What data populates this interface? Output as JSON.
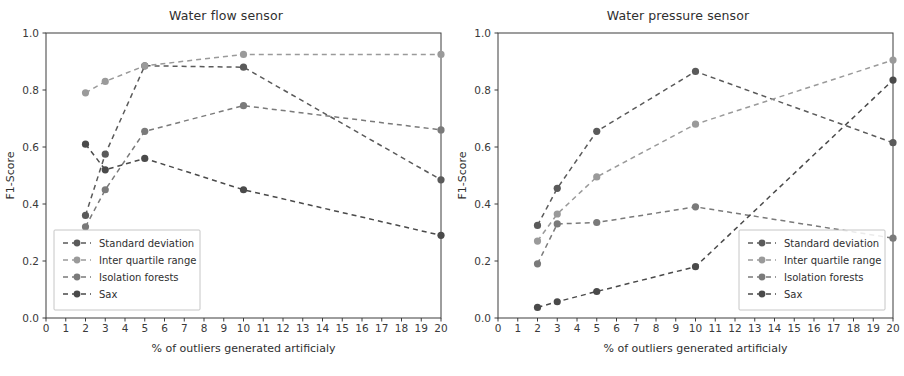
{
  "figure": {
    "width": 904,
    "height": 376,
    "background": "#ffffff"
  },
  "axis": {
    "xlabel": "% of outliers generated artificialy",
    "ylabel": "F1-Score",
    "yticks": [
      "0.0",
      "0.2",
      "0.4",
      "0.6",
      "0.8",
      "1.0"
    ],
    "xticks": [
      "0",
      "1",
      "2",
      "3",
      "4",
      "5",
      "6",
      "7",
      "8",
      "9",
      "10",
      "11",
      "12",
      "13",
      "14",
      "15",
      "16",
      "17",
      "18",
      "19",
      "20"
    ]
  },
  "legend": {
    "labels": [
      "Standard deviation",
      "Inter quartile range",
      "Isolation forests",
      "Sax"
    ]
  },
  "colors": {
    "standard_deviation": "#5a5a5a",
    "inter_quartile_range": "#9a9a9a",
    "isolation_forests": "#7a7a7a",
    "sax": "#4a4a4a",
    "axis": "#3c3c3c",
    "text": "#2f2f2f"
  },
  "chart_data": [
    {
      "type": "line",
      "title": "Water flow sensor",
      "xlabel": "% of outliers generated artificialy",
      "ylabel": "F1-Score",
      "xlim": [
        0,
        20
      ],
      "ylim": [
        0.0,
        1.0
      ],
      "grid": false,
      "legend_position": "lower left",
      "x": [
        2,
        3,
        5,
        10,
        20
      ],
      "series": [
        {
          "name": "Standard deviation",
          "values": [
            0.36,
            0.575,
            0.885,
            0.88,
            0.485
          ]
        },
        {
          "name": "Inter quartile range",
          "values": [
            0.79,
            0.83,
            0.885,
            0.925,
            0.925
          ]
        },
        {
          "name": "Isolation forests",
          "values": [
            0.32,
            0.45,
            0.655,
            0.745,
            0.66
          ]
        },
        {
          "name": "Sax",
          "values": [
            0.61,
            0.52,
            0.56,
            0.45,
            0.29
          ]
        }
      ]
    },
    {
      "type": "line",
      "title": "Water pressure sensor",
      "xlabel": "% of outliers generated artificialy",
      "ylabel": "F1-Score",
      "xlim": [
        0,
        20
      ],
      "ylim": [
        0.0,
        1.0
      ],
      "grid": false,
      "legend_position": "lower right",
      "x": [
        2,
        3,
        5,
        10,
        20
      ],
      "series": [
        {
          "name": "Standard deviation",
          "values": [
            0.325,
            0.455,
            0.655,
            0.865,
            0.615
          ]
        },
        {
          "name": "Inter quartile range",
          "values": [
            0.27,
            0.365,
            0.495,
            0.68,
            0.905
          ]
        },
        {
          "name": "Isolation forests",
          "values": [
            0.19,
            0.33,
            0.335,
            0.39,
            0.28
          ]
        },
        {
          "name": "Sax",
          "values": [
            0.037,
            0.057,
            0.093,
            0.18,
            0.835
          ]
        }
      ]
    }
  ]
}
